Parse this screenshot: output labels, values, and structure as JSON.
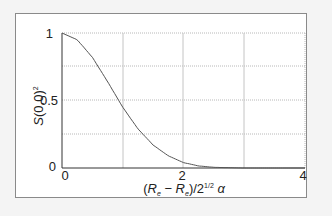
{
  "chart_data": {
    "type": "line",
    "title": "",
    "xlabel": "(R_e − R_e')/2^{1/2} α",
    "ylabel": "S(0,0)²",
    "xlim": [
      0,
      4
    ],
    "ylim": [
      0,
      1
    ],
    "grid": true,
    "x_ticks": [
      "0",
      "2",
      "4"
    ],
    "y_ticks": [
      "0",
      "0.5",
      "1"
    ],
    "series": [
      {
        "name": "S(0,0)^2",
        "x": [
          0,
          0.25,
          0.5,
          0.75,
          1.0,
          1.25,
          1.5,
          1.75,
          2.0,
          2.25,
          2.5,
          3.0,
          3.5,
          4.0
        ],
        "values": [
          1.0,
          0.95,
          0.82,
          0.64,
          0.45,
          0.29,
          0.17,
          0.09,
          0.04,
          0.015,
          0.005,
          0.0,
          0.0,
          0.0
        ]
      }
    ],
    "colors": {
      "curve": "#555555",
      "grid": "#b0b0b0",
      "axis": "#333333"
    }
  },
  "axes": {
    "y_label_main": "S(0,0)",
    "y_label_sup": "2",
    "x_label_open": "(R",
    "x_label_sub1": "e",
    "x_label_minus": " − R",
    "x_label_sub2": "e",
    "x_label_close": ")/2",
    "x_label_sup": "1/2",
    "x_label_alpha": "α",
    "tick_y_0": "0",
    "tick_y_05": "0.5",
    "tick_y_1": "1",
    "tick_x_0": "0",
    "tick_x_2": "2",
    "tick_x_4": "4"
  }
}
